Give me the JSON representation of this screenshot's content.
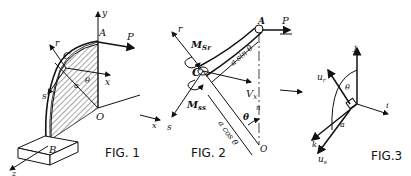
{
  "figures": [
    {
      "id": "fig1",
      "caption": "FIG. 1",
      "labels": {
        "y_axis": "y",
        "x_axis_right": "x",
        "x_axis_bottom": "x",
        "z_axis": "z",
        "point_a": "A",
        "point_b": "B",
        "point_c": "C",
        "point_o": "O",
        "force": "P",
        "r_axis": "r",
        "s_axis": "s",
        "radius": "a",
        "angle": "θ"
      }
    },
    {
      "id": "fig2",
      "caption": "FIG. 2",
      "labels": {
        "point_a": "A",
        "point_c": "C",
        "point_o": "O",
        "force": "P",
        "r_axis": "r",
        "s_axis": "s",
        "x_axis": "x",
        "moment_sr": "M",
        "moment_sr_sub": "Sr",
        "moment_ss": "M",
        "moment_ss_sub": "ss",
        "shear": "V",
        "shear_sub": "x",
        "a_sin": "a sin θ",
        "a_cos": "a cos θ",
        "angle": "θ",
        "n": "n"
      }
    },
    {
      "id": "fig3",
      "caption": "FIG.3",
      "labels": {
        "j": "j",
        "i": "i",
        "k": "k",
        "u_r": "u",
        "u_r_sub": "r",
        "u_s": "u",
        "u_s_sub": "s",
        "angle": "θ",
        "radius": "a"
      }
    }
  ]
}
